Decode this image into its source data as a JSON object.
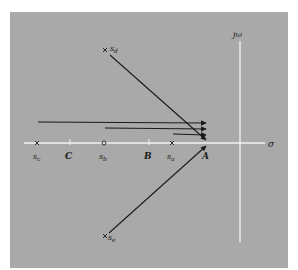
{
  "diagram": {
    "type": "s-plane pole-zero vector diagram",
    "colors": {
      "background": "#ffffff",
      "panel": "#a9a9a9",
      "axes": "#f2f2f2",
      "ink": "#1a1a1a"
    },
    "axes": {
      "real_label": "σ",
      "imag_label": "jω"
    },
    "test_point": {
      "label": "A"
    },
    "points": [
      {
        "id": "s_c",
        "base": "s",
        "sub": "c",
        "kind": "pole"
      },
      {
        "id": "C",
        "label": "C",
        "kind": "tick"
      },
      {
        "id": "s_b",
        "base": "s",
        "sub": "b",
        "kind": "zero"
      },
      {
        "id": "B",
        "label": "B",
        "kind": "tick"
      },
      {
        "id": "s_a",
        "base": "s",
        "sub": "a",
        "kind": "pole"
      },
      {
        "id": "s_d",
        "base": "s",
        "sub": "d",
        "kind": "pole"
      },
      {
        "id": "s_e",
        "base": "s",
        "sub": "e",
        "kind": "pole"
      }
    ],
    "vectors": [
      {
        "from": "s_c",
        "to": "A"
      },
      {
        "from": "s_b",
        "to": "A"
      },
      {
        "from": "s_a",
        "to": "A"
      },
      {
        "from": "s_d",
        "to": "A"
      },
      {
        "from": "s_e",
        "to": "A"
      }
    ]
  }
}
